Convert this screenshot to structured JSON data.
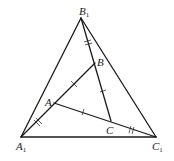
{
  "figure": {
    "type": "geometry-diagram",
    "points": {
      "A1": {
        "x": 21,
        "y": 137,
        "label": "A",
        "sub": "1"
      },
      "B1": {
        "x": 81,
        "y": 18,
        "label": "B",
        "sub": "1"
      },
      "C1": {
        "x": 156,
        "y": 137,
        "label": "C",
        "sub": "1"
      },
      "A": {
        "x": 54,
        "y": 103,
        "label": "A"
      },
      "B": {
        "x": 95,
        "y": 63,
        "label": "B"
      },
      "C": {
        "x": 111,
        "y": 121,
        "label": "C"
      }
    },
    "segments": [
      [
        "A1",
        "B1"
      ],
      [
        "B1",
        "C1"
      ],
      [
        "A1",
        "C1"
      ],
      [
        "A1",
        "B"
      ],
      [
        "B1",
        "C"
      ],
      [
        "A",
        "C1"
      ]
    ],
    "tick_marks": {
      "single": [
        "AB",
        "BC",
        "CA"
      ],
      "double": [
        "A1A",
        "B1B",
        "CC1"
      ]
    },
    "colors": {
      "line": "#1a1a1a",
      "background": "#ffffff"
    }
  }
}
